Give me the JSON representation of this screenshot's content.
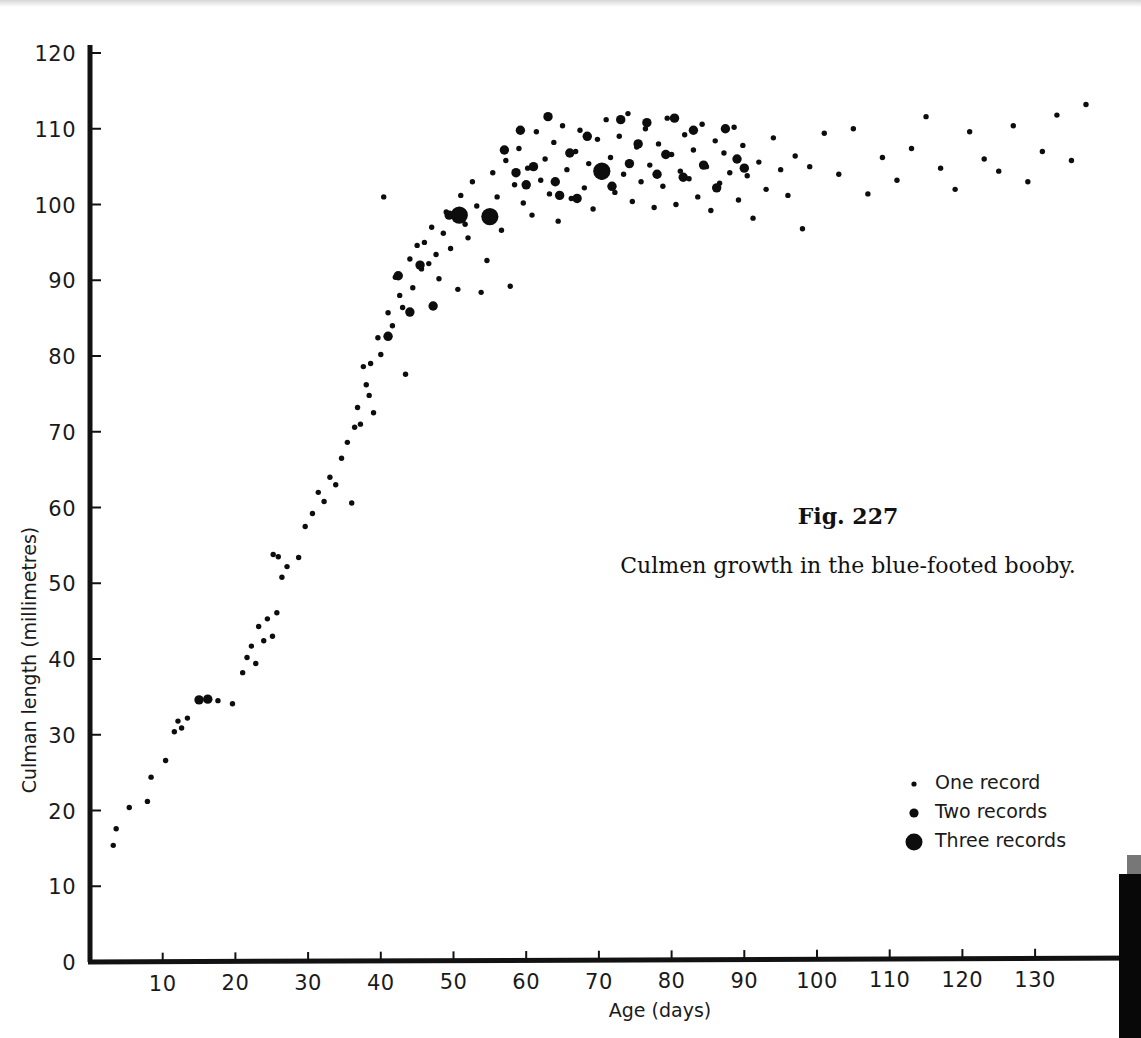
{
  "figure": {
    "number_label": "Fig. 227",
    "caption": "Culmen growth in the blue-footed booby."
  },
  "legend": {
    "items": [
      {
        "label": "One record",
        "marker": "small-dot",
        "radius": 2.6
      },
      {
        "label": "Two records",
        "marker": "medium-dot",
        "radius": 4.6
      },
      {
        "label": "Three records",
        "marker": "large-dot",
        "radius": 8.5
      }
    ]
  },
  "colors": {
    "ink": "#0d0d0d",
    "axis": "#121212",
    "background": "#ffffff",
    "page_edge_shadow": "#080808"
  },
  "chart_data": {
    "type": "scatter",
    "title": "Fig. 227",
    "subtitle": "Culmen growth in the blue-footed booby.",
    "xlabel": "Age (days)",
    "ylabel": "Culman length (millimetres)",
    "xlim": [
      0,
      138
    ],
    "ylim": [
      0,
      120
    ],
    "xticks": [
      10,
      20,
      30,
      40,
      50,
      60,
      70,
      80,
      90,
      100,
      110,
      120,
      130
    ],
    "yticks": [
      0,
      10,
      20,
      30,
      40,
      50,
      60,
      70,
      80,
      90,
      100,
      110,
      120
    ],
    "grid": false,
    "legend_position": "lower-right",
    "series": [
      {
        "name": "One record",
        "marker_size": 1,
        "points": [
          [
            3.2,
            15.4
          ],
          [
            3.6,
            17.6
          ],
          [
            5.4,
            20.4
          ],
          [
            7.9,
            21.2
          ],
          [
            8.4,
            24.4
          ],
          [
            10.4,
            26.6
          ],
          [
            11.6,
            30.4
          ],
          [
            12.1,
            31.8
          ],
          [
            12.6,
            30.9
          ],
          [
            13.4,
            32.2
          ],
          [
            17.6,
            34.5
          ],
          [
            19.6,
            34.1
          ],
          [
            21.0,
            38.2
          ],
          [
            21.6,
            40.2
          ],
          [
            22.2,
            41.7
          ],
          [
            22.8,
            39.4
          ],
          [
            23.2,
            44.3
          ],
          [
            23.9,
            42.4
          ],
          [
            24.4,
            45.3
          ],
          [
            25.1,
            43.0
          ],
          [
            25.7,
            46.1
          ],
          [
            25.2,
            53.8
          ],
          [
            25.9,
            53.5
          ],
          [
            26.4,
            50.8
          ],
          [
            27.1,
            52.2
          ],
          [
            28.7,
            53.4
          ],
          [
            29.6,
            57.5
          ],
          [
            30.6,
            59.2
          ],
          [
            31.4,
            62.0
          ],
          [
            32.2,
            60.8
          ],
          [
            33.0,
            64.0
          ],
          [
            33.8,
            63.0
          ],
          [
            34.6,
            66.5
          ],
          [
            35.4,
            68.6
          ],
          [
            36.0,
            60.6
          ],
          [
            36.4,
            70.6
          ],
          [
            36.8,
            73.2
          ],
          [
            37.2,
            71.0
          ],
          [
            37.6,
            78.6
          ],
          [
            38.0,
            76.2
          ],
          [
            38.4,
            74.8
          ],
          [
            38.6,
            79.0
          ],
          [
            39.0,
            72.5
          ],
          [
            39.6,
            82.4
          ],
          [
            40.0,
            80.2
          ],
          [
            40.4,
            101.0
          ],
          [
            41.0,
            85.7
          ],
          [
            41.6,
            84.0
          ],
          [
            42.0,
            90.4
          ],
          [
            42.6,
            88.0
          ],
          [
            43.0,
            86.4
          ],
          [
            43.4,
            77.6
          ],
          [
            44.0,
            92.8
          ],
          [
            44.4,
            89.0
          ],
          [
            45.0,
            94.6
          ],
          [
            45.6,
            91.5
          ],
          [
            46.0,
            95.0
          ],
          [
            46.6,
            92.2
          ],
          [
            47.0,
            97.0
          ],
          [
            47.6,
            93.4
          ],
          [
            48.0,
            90.2
          ],
          [
            48.6,
            96.2
          ],
          [
            49.0,
            99.0
          ],
          [
            49.6,
            94.2
          ],
          [
            50.0,
            98.6
          ],
          [
            50.6,
            88.8
          ],
          [
            51.0,
            101.2
          ],
          [
            51.6,
            97.4
          ],
          [
            52.0,
            95.6
          ],
          [
            52.6,
            103.0
          ],
          [
            53.2,
            99.8
          ],
          [
            53.8,
            88.4
          ],
          [
            54.6,
            92.6
          ],
          [
            55.4,
            104.2
          ],
          [
            56.0,
            101.0
          ],
          [
            56.6,
            96.6
          ],
          [
            57.2,
            105.8
          ],
          [
            57.8,
            89.2
          ],
          [
            58.4,
            102.6
          ],
          [
            59.0,
            107.4
          ],
          [
            59.6,
            100.2
          ],
          [
            60.2,
            104.8
          ],
          [
            60.8,
            98.6
          ],
          [
            61.4,
            109.6
          ],
          [
            62.0,
            103.2
          ],
          [
            62.6,
            106.0
          ],
          [
            63.2,
            101.4
          ],
          [
            63.8,
            108.2
          ],
          [
            64.4,
            97.8
          ],
          [
            65.0,
            110.4
          ],
          [
            65.6,
            104.6
          ],
          [
            66.2,
            100.8
          ],
          [
            66.8,
            107.0
          ],
          [
            67.4,
            109.8
          ],
          [
            68.0,
            102.2
          ],
          [
            68.6,
            105.4
          ],
          [
            69.2,
            99.4
          ],
          [
            69.8,
            108.6
          ],
          [
            70.4,
            103.6
          ],
          [
            71.0,
            111.2
          ],
          [
            71.6,
            106.2
          ],
          [
            72.2,
            101.6
          ],
          [
            72.8,
            109.0
          ],
          [
            73.4,
            104.0
          ],
          [
            74.0,
            112.0
          ],
          [
            74.6,
            100.4
          ],
          [
            75.2,
            107.6
          ],
          [
            75.8,
            103.0
          ],
          [
            76.4,
            110.0
          ],
          [
            77.0,
            105.2
          ],
          [
            77.6,
            99.6
          ],
          [
            78.2,
            108.0
          ],
          [
            78.8,
            102.4
          ],
          [
            79.4,
            111.4
          ],
          [
            80.0,
            106.6
          ],
          [
            80.6,
            100.0
          ],
          [
            81.2,
            104.4
          ],
          [
            81.8,
            109.2
          ],
          [
            82.4,
            103.4
          ],
          [
            83.0,
            107.2
          ],
          [
            83.6,
            101.0
          ],
          [
            84.2,
            110.6
          ],
          [
            84.8,
            105.0
          ],
          [
            85.4,
            99.2
          ],
          [
            86.0,
            108.4
          ],
          [
            86.6,
            102.8
          ],
          [
            87.2,
            106.8
          ],
          [
            88.0,
            104.2
          ],
          [
            88.6,
            110.2
          ],
          [
            89.2,
            100.6
          ],
          [
            89.8,
            107.8
          ],
          [
            90.4,
            103.8
          ],
          [
            91.2,
            98.2
          ],
          [
            92.0,
            105.6
          ],
          [
            93.0,
            102.0
          ],
          [
            94.0,
            108.8
          ],
          [
            95.0,
            104.6
          ],
          [
            96.0,
            101.2
          ],
          [
            97.0,
            106.4
          ],
          [
            98.0,
            96.8
          ],
          [
            99.0,
            105.0
          ],
          [
            101.0,
            109.4
          ],
          [
            103.0,
            104.0
          ],
          [
            105.0,
            110.0
          ],
          [
            107.0,
            101.4
          ],
          [
            109.0,
            106.2
          ],
          [
            111.0,
            103.2
          ],
          [
            113.0,
            107.4
          ],
          [
            115.0,
            111.6
          ],
          [
            117.0,
            104.8
          ],
          [
            119.0,
            102.0
          ],
          [
            121.0,
            109.6
          ],
          [
            123.0,
            106.0
          ],
          [
            125.0,
            104.4
          ],
          [
            127.0,
            110.4
          ],
          [
            129.0,
            103.0
          ],
          [
            131.0,
            107.0
          ],
          [
            133.0,
            111.8
          ],
          [
            135.0,
            105.8
          ],
          [
            137.0,
            113.2
          ]
        ]
      },
      {
        "name": "Two records",
        "marker_size": 2,
        "points": [
          [
            15.0,
            34.6
          ],
          [
            16.2,
            34.7
          ],
          [
            41.0,
            82.6
          ],
          [
            44.0,
            85.8
          ],
          [
            42.4,
            90.6
          ],
          [
            45.4,
            92.0
          ],
          [
            47.2,
            86.6
          ],
          [
            49.4,
            98.6
          ],
          [
            57.0,
            107.2
          ],
          [
            58.6,
            104.2
          ],
          [
            59.2,
            109.8
          ],
          [
            60.0,
            102.6
          ],
          [
            61.0,
            105.0
          ],
          [
            63.0,
            111.6
          ],
          [
            64.0,
            103.0
          ],
          [
            64.6,
            101.2
          ],
          [
            66.0,
            106.8
          ],
          [
            67.0,
            100.8
          ],
          [
            68.4,
            109.0
          ],
          [
            70.0,
            104.6
          ],
          [
            71.8,
            102.4
          ],
          [
            73.0,
            111.2
          ],
          [
            74.2,
            105.4
          ],
          [
            75.4,
            108.0
          ],
          [
            76.6,
            110.8
          ],
          [
            78.0,
            104.0
          ],
          [
            79.2,
            106.6
          ],
          [
            80.4,
            111.4
          ],
          [
            81.6,
            103.6
          ],
          [
            83.0,
            109.8
          ],
          [
            84.4,
            105.2
          ],
          [
            86.2,
            102.2
          ],
          [
            87.4,
            110.0
          ],
          [
            89.0,
            106.0
          ],
          [
            90.0,
            104.8
          ]
        ]
      },
      {
        "name": "Three records",
        "marker_size": 3,
        "points": [
          [
            50.8,
            98.6
          ],
          [
            55.0,
            98.4
          ],
          [
            70.4,
            104.4
          ]
        ]
      }
    ]
  },
  "axes": {
    "x_origin_px": 90,
    "y_origin_px": 962,
    "x_scale_px_per_day": 7.27,
    "y_scale_px_per_mm": 7.575
  }
}
